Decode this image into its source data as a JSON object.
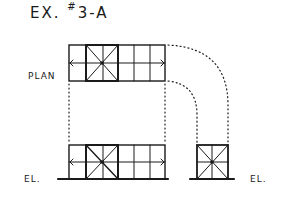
{
  "diagram": {
    "title_prefix": "EX.",
    "title_hash": "#",
    "title_suffix": "3-A",
    "labels": {
      "plan": "PLAN",
      "elevation_left": "EL.",
      "elevation_right": "EL."
    },
    "colors": {
      "line": "#1a1a1a",
      "background": "#ffffff"
    }
  }
}
